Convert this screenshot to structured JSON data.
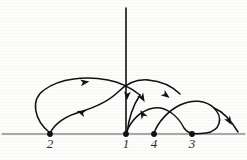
{
  "figure": {
    "kind": "diagram",
    "background_color": "#fdfdfc",
    "ink_color": "#111111",
    "axis_color": "#555555"
  },
  "axis": {
    "name": "horizontal-axis",
    "y": 134,
    "x_start": 2,
    "x_end": 245,
    "stroke_width": 1.1
  },
  "vertical_spike": {
    "name": "vertical-spike",
    "x": 126,
    "y_top": 8,
    "y_bottom": 134
  },
  "points": [
    {
      "label": "2",
      "x": 50,
      "y": 134,
      "label_x": 42,
      "label_y": 137
    },
    {
      "label": "1",
      "x": 126,
      "y": 134,
      "label_x": 118,
      "label_y": 137
    },
    {
      "label": "4",
      "x": 154,
      "y": 134,
      "label_x": 146,
      "label_y": 137
    },
    {
      "label": "3",
      "x": 192,
      "y": 134,
      "label_x": 184,
      "label_y": 137
    }
  ],
  "curves": [
    {
      "name": "outer-upper-arc",
      "d": "M 50 133 C 34 120 30 100 44 90 C 60 78 86 76 108 80 C 120 82 131 88 140 95"
    },
    {
      "name": "inner-return-arc",
      "d": "M 50 133 C 56 122 66 116 80 112 C 96 107 110 100 118 92 C 126 84 136 79 148 80"
    },
    {
      "name": "center-descending-branch",
      "d": "M 140 95 C 134 104 129 116 127 133"
    },
    {
      "name": "left-crossing-to-four",
      "d": "M 148 80 C 160 81 172 86 180 94"
    },
    {
      "name": "lower-left-lobe",
      "d": "M 126 133 C 131 120 141 110 154 108 C 166 106 178 116 184 128 C 187 132 189 133 192 133"
    },
    {
      "name": "lower-right-lobe",
      "d": "M 154 133 C 158 122 168 111 180 105 C 192 99 206 100 214 108 C 224 118 220 131 206 133 C 198 134 194 134 192 133"
    },
    {
      "name": "right-tail",
      "d": "M 214 108 C 224 112 232 122 238 132"
    }
  ],
  "arrows": [
    {
      "name": "arrow-upper-right",
      "x": 86,
      "y": 82,
      "angle": -8
    },
    {
      "name": "arrow-inner-left",
      "x": 80,
      "y": 112,
      "angle": 198
    },
    {
      "name": "arrow-center-down",
      "x": 127,
      "y": 97,
      "angle": 95
    },
    {
      "name": "arrow-branch-down",
      "x": 143,
      "y": 99,
      "angle": 60
    },
    {
      "name": "arrow-lobe-downright",
      "x": 167,
      "y": 96,
      "angle": 38
    },
    {
      "name": "arrow-up-to-one",
      "x": 142,
      "y": 113,
      "angle": -118
    },
    {
      "name": "arrow-right-tail",
      "x": 230,
      "y": 122,
      "angle": 58
    }
  ]
}
